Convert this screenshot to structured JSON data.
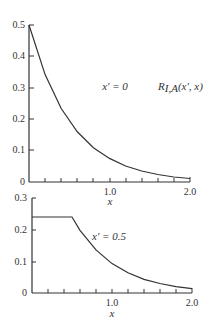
{
  "chart_data": [
    {
      "type": "line",
      "title": "",
      "xlabel": "x",
      "ylabel": "",
      "xlim": [
        0,
        2.0
      ],
      "ylim": [
        0,
        0.5
      ],
      "x_ticks_labeled": [
        "1.0",
        "2.0"
      ],
      "y_ticks": [
        "0",
        "0.1",
        "0.2",
        "0.3",
        "0.4",
        "0.5"
      ],
      "grid": false,
      "annotations": [
        "x′ = 0",
        "R_{I,A}(x′, x)"
      ],
      "series": [
        {
          "name": "x′ = 0",
          "x": [
            0,
            0.2,
            0.4,
            0.6,
            0.8,
            1.0,
            1.2,
            1.4,
            1.6,
            1.8,
            2.0
          ],
          "values": [
            0.5,
            0.342,
            0.234,
            0.16,
            0.109,
            0.075,
            0.051,
            0.035,
            0.024,
            0.016,
            0.011
          ]
        }
      ]
    },
    {
      "type": "line",
      "title": "",
      "xlabel": "x",
      "ylabel": "",
      "xlim": [
        0,
        2.0
      ],
      "ylim": [
        0,
        0.3
      ],
      "x_ticks_labeled": [
        "1.0",
        "2.0"
      ],
      "y_ticks": [
        "0",
        "0.1",
        "0.2",
        "0.3"
      ],
      "grid": false,
      "annotations": [
        "x′ = 0.5"
      ],
      "series": [
        {
          "name": "x′ = 0.5",
          "x": [
            0,
            0.25,
            0.5,
            0.6,
            0.8,
            1.0,
            1.2,
            1.4,
            1.6,
            1.8,
            2.0
          ],
          "values": [
            0.24,
            0.24,
            0.24,
            0.198,
            0.136,
            0.093,
            0.064,
            0.043,
            0.03,
            0.02,
            0.014
          ]
        }
      ]
    }
  ],
  "top": {
    "y_labels": [
      "0.5",
      "0.4",
      "0.3",
      "0.2",
      "0.1",
      "0"
    ],
    "x_labels": [
      "1.0",
      "2.0"
    ],
    "xlabel": "x",
    "annotation": "x′ = 0",
    "function_label_main": "R",
    "function_label_sub": "I,A",
    "function_label_args": "(x′, x)"
  },
  "bottom": {
    "y_labels": [
      "0.3",
      "0.2",
      "0.1",
      "0"
    ],
    "x_labels": [
      "1.0",
      "2.0"
    ],
    "xlabel": "x",
    "annotation": "x′ = 0.5"
  }
}
